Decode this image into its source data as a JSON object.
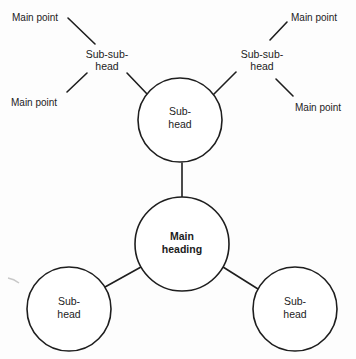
{
  "diagram": {
    "type": "mind-map",
    "colors": {
      "line": "#1e1e1e",
      "text": "#1c1c1c",
      "background": "#fdfdfd"
    },
    "nodes": {
      "main": {
        "line1": "Main",
        "line2": "heading"
      },
      "sub_top": {
        "line1": "Sub-",
        "line2": "head"
      },
      "sub_bottom_left": {
        "line1": "Sub-",
        "line2": "head"
      },
      "sub_bottom_right": {
        "line1": "Sub-",
        "line2": "head"
      },
      "subsub_left": {
        "line1": "Sub-sub-",
        "line2": "head"
      },
      "subsub_right": {
        "line1": "Sub-sub-",
        "line2": "head"
      },
      "point_top_left": {
        "label": "Main point"
      },
      "point_bottom_left": {
        "label": "Main point"
      },
      "point_top_right": {
        "label": "Main point"
      },
      "point_bottom_right": {
        "label": "Main point"
      }
    }
  }
}
